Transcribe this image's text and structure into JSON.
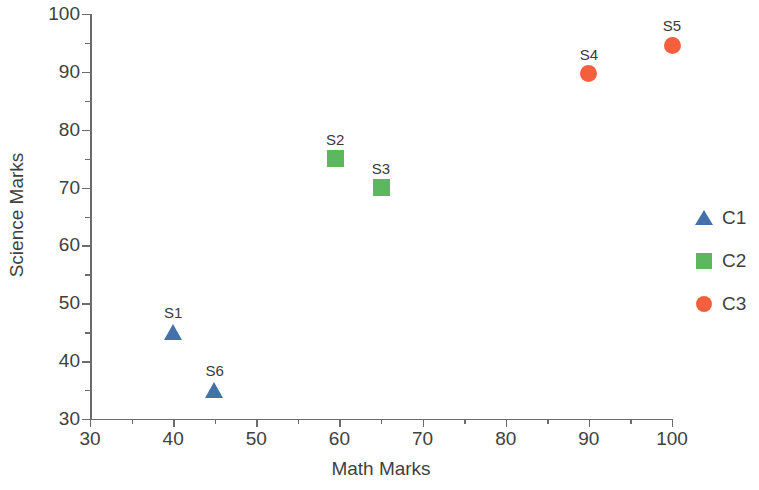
{
  "chart_data": {
    "type": "scatter",
    "title": "",
    "xlabel": "Math Marks",
    "ylabel": "Science Marks",
    "xlim": [
      30,
      100
    ],
    "ylim": [
      30,
      100
    ],
    "x_ticks": [
      30,
      40,
      50,
      60,
      70,
      80,
      90,
      100
    ],
    "y_ticks": [
      30,
      40,
      50,
      60,
      70,
      80,
      90,
      100
    ],
    "x_minor_ticks": [
      35,
      45,
      55,
      65,
      75,
      85,
      95
    ],
    "y_minor_ticks": [
      35,
      45,
      55,
      65,
      75,
      85,
      95
    ],
    "grid": false,
    "legend_position": "right",
    "series": [
      {
        "name": "C1",
        "marker": "triangle",
        "color": "#4472A8",
        "points": [
          {
            "label": "S1",
            "x": 40,
            "y": 45
          },
          {
            "label": "S6",
            "x": 45,
            "y": 35
          }
        ]
      },
      {
        "name": "C2",
        "marker": "square",
        "color": "#5CB85C",
        "points": [
          {
            "label": "S2",
            "x": 59.5,
            "y": 75
          },
          {
            "label": "S3",
            "x": 65,
            "y": 70
          }
        ]
      },
      {
        "name": "C3",
        "marker": "circle",
        "color": "#F4603E",
        "points": [
          {
            "label": "S4",
            "x": 90,
            "y": 89.7
          },
          {
            "label": "S5",
            "x": 100,
            "y": 94.6
          }
        ]
      }
    ]
  },
  "legend": {
    "items": [
      {
        "label": "C1",
        "marker": "triangle",
        "color": "#4472A8"
      },
      {
        "label": "C2",
        "marker": "square",
        "color": "#5CB85C"
      },
      {
        "label": "C3",
        "marker": "circle",
        "color": "#F4603E"
      }
    ]
  }
}
